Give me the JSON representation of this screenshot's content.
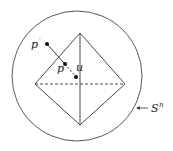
{
  "diagram": {
    "type": "octahedron inscribed in sphere",
    "labels": {
      "p_prime": "p",
      "p_prime_mark": "′",
      "p": "p",
      "u": "u",
      "sphere": "S",
      "sphere_sup": "n"
    },
    "colors": {
      "stroke": "#333333",
      "background": "#ffffff"
    }
  }
}
